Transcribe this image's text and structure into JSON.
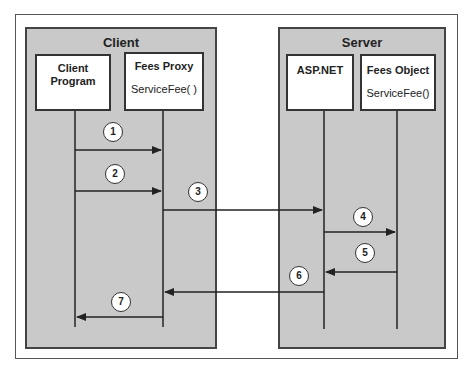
{
  "diagram": {
    "client": {
      "title": "Client",
      "boxes": [
        {
          "name": "Client Program",
          "line1": "Client",
          "line2": "Program",
          "method": ""
        },
        {
          "name": "Fees Proxy",
          "line1": "Fees Proxy",
          "line2": "",
          "method": "ServiceFee( )"
        }
      ]
    },
    "server": {
      "title": "Server",
      "boxes": [
        {
          "name": "ASP.NET",
          "line1": "ASP.NET",
          "line2": "",
          "method": ""
        },
        {
          "name": "Fees Object",
          "line1": "Fees Object",
          "line2": "",
          "method": "ServiceFee()"
        }
      ]
    },
    "steps": [
      {
        "label": "1",
        "from": "Client Program",
        "to": "Fees Proxy"
      },
      {
        "label": "2",
        "from": "Client Program",
        "to": "Fees Proxy"
      },
      {
        "label": "3",
        "from": "Fees Proxy",
        "to": "ASP.NET"
      },
      {
        "label": "4",
        "from": "ASP.NET",
        "to": "Fees Object"
      },
      {
        "label": "5",
        "from": "Fees Object",
        "to": "ASP.NET"
      },
      {
        "label": "6",
        "from": "ASP.NET",
        "to": "Fees Proxy"
      },
      {
        "label": "7",
        "from": "Fees Proxy",
        "to": "Client Program"
      }
    ],
    "colors": {
      "panel_fill": "#c9c9c9",
      "line": "#222222",
      "box_fill": "#ffffff"
    }
  }
}
